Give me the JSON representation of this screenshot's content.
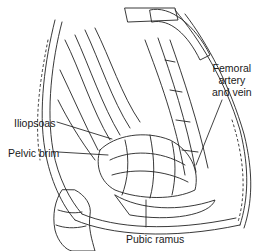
{
  "figure": {
    "type": "surgical-illustration",
    "labels": {
      "femoral": [
        "Femoral",
        "artery",
        "and vein"
      ],
      "iliopsoas": "Iliopsoas",
      "pelvic_brim": "Pelvic brim",
      "pubic_ramus": "Pubic ramus"
    },
    "colors": {
      "ink": "#1a1a1a",
      "background": "#ffffff"
    }
  }
}
